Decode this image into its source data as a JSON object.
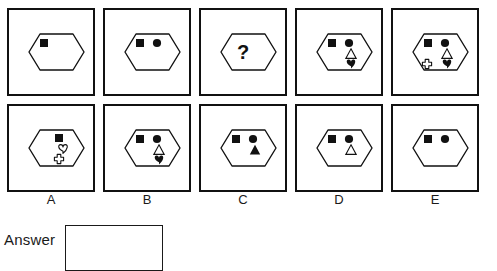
{
  "puzzle": {
    "type": "matrix-reasoning-multiple-choice",
    "question_mark": "?",
    "sequence": [
      {
        "name": "sequence-cell-1",
        "position": 1,
        "shapes": [
          {
            "shape": "square",
            "fill": "filled",
            "slot": "top-left"
          }
        ]
      },
      {
        "name": "sequence-cell-2",
        "position": 2,
        "shapes": [
          {
            "shape": "square",
            "fill": "filled",
            "slot": "top-left"
          },
          {
            "shape": "circle",
            "fill": "filled",
            "slot": "top-right"
          }
        ]
      },
      {
        "name": "sequence-cell-3",
        "position": 3,
        "shapes": [],
        "is_question": true
      },
      {
        "name": "sequence-cell-4",
        "position": 4,
        "shapes": [
          {
            "shape": "square",
            "fill": "filled",
            "slot": "top-left"
          },
          {
            "shape": "circle",
            "fill": "filled",
            "slot": "top-right"
          },
          {
            "shape": "triangle",
            "fill": "hollow",
            "slot": "mid-right"
          },
          {
            "shape": "heart",
            "fill": "filled",
            "slot": "bottom-right"
          }
        ]
      },
      {
        "name": "sequence-cell-5",
        "position": 5,
        "shapes": [
          {
            "shape": "square",
            "fill": "filled",
            "slot": "top-left"
          },
          {
            "shape": "circle",
            "fill": "filled",
            "slot": "top-right"
          },
          {
            "shape": "triangle",
            "fill": "hollow",
            "slot": "mid-right"
          },
          {
            "shape": "cross",
            "fill": "hollow",
            "slot": "bottom-left"
          },
          {
            "shape": "heart",
            "fill": "filled",
            "slot": "bottom-right"
          }
        ]
      }
    ],
    "options": [
      {
        "label": "A",
        "name": "option-a",
        "shapes": [
          {
            "shape": "square",
            "fill": "filled",
            "slot": "top-right"
          },
          {
            "shape": "heart",
            "fill": "hollow",
            "slot": "mid-right"
          },
          {
            "shape": "cross",
            "fill": "hollow",
            "slot": "bottom-right"
          }
        ]
      },
      {
        "label": "B",
        "name": "option-b",
        "shapes": [
          {
            "shape": "square",
            "fill": "filled",
            "slot": "top-left"
          },
          {
            "shape": "circle",
            "fill": "filled",
            "slot": "top-right"
          },
          {
            "shape": "triangle",
            "fill": "hollow",
            "slot": "mid-right"
          },
          {
            "shape": "heart",
            "fill": "filled",
            "slot": "bottom-right"
          }
        ]
      },
      {
        "label": "C",
        "name": "option-c",
        "shapes": [
          {
            "shape": "square",
            "fill": "filled",
            "slot": "top-left"
          },
          {
            "shape": "circle",
            "fill": "filled",
            "slot": "top-right"
          },
          {
            "shape": "triangle",
            "fill": "filled",
            "slot": "mid-right"
          }
        ]
      },
      {
        "label": "D",
        "name": "option-d",
        "shapes": [
          {
            "shape": "square",
            "fill": "filled",
            "slot": "top-left"
          },
          {
            "shape": "circle",
            "fill": "filled",
            "slot": "top-right"
          },
          {
            "shape": "triangle",
            "fill": "hollow",
            "slot": "mid-right"
          }
        ]
      },
      {
        "label": "E",
        "name": "option-e",
        "shapes": [
          {
            "shape": "square",
            "fill": "filled",
            "slot": "top-left"
          },
          {
            "shape": "circle",
            "fill": "filled",
            "slot": "top-right"
          }
        ]
      }
    ]
  },
  "answer": {
    "label": "Answer",
    "value": "",
    "placeholder": ""
  },
  "colors": {
    "ink": "#111111",
    "panel_border": "#111111",
    "background": "#ffffff"
  }
}
